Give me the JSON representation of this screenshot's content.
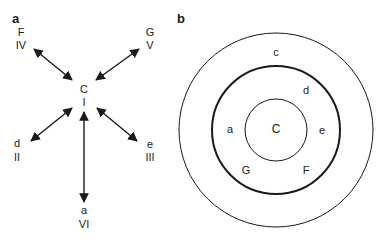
{
  "panels": {
    "a": {
      "label": "a",
      "center": {
        "letter": "C",
        "numeral": "I"
      },
      "nodes": [
        {
          "id": "top-left",
          "letter": "F",
          "numeral": "IV"
        },
        {
          "id": "top-right",
          "letter": "G",
          "numeral": "V"
        },
        {
          "id": "bottom-left",
          "letter": "d",
          "numeral": "II"
        },
        {
          "id": "bottom-right",
          "letter": "e",
          "numeral": "III"
        },
        {
          "id": "bottom",
          "letter": "a",
          "numeral": "VI"
        }
      ]
    },
    "b": {
      "label": "b",
      "circles": [
        "outer",
        "middle-thick",
        "inner"
      ],
      "labels": {
        "center": "C",
        "outer_ring_top": "c",
        "mid_ring_upper_right": "d",
        "mid_ring_left": "a",
        "mid_ring_right": "e",
        "mid_ring_lower_left": "G",
        "mid_ring_lower_right": "F"
      }
    }
  }
}
